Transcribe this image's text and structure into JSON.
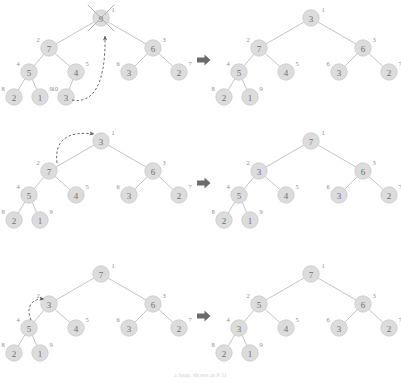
{
  "figure": {
    "implies_symbol": "⇒",
    "caption": "a heap, shown as 9 11",
    "colors": {
      "node_fill": "#dcdcdc",
      "node_stroke": "#c9c9c9",
      "edge": "#b4b4b4",
      "node_text": "#6f6f6f",
      "index_text": "#8d8d8d",
      "dashed_arrow": "#5a5a5a",
      "implies": "#6b6b6b",
      "background": "#ffffff"
    },
    "rows": [
      {
        "id": "row-1",
        "before": {
          "id": "tree-1-before",
          "nodes": [
            {
              "index": 1,
              "value": "9",
              "x": 101,
              "y": 18,
              "crossed": true
            },
            {
              "index": 2,
              "value": "7",
              "x": 49,
              "y": 48,
              "crossed": false
            },
            {
              "index": 3,
              "value": "6",
              "x": 153,
              "y": 48,
              "crossed": false
            },
            {
              "index": 4,
              "value": "5",
              "x": 29,
              "y": 72,
              "crossed": false
            },
            {
              "index": 5,
              "value": "4",
              "x": 76,
              "y": 72,
              "crossed": false
            },
            {
              "index": 6,
              "value": "3",
              "x": 129,
              "y": 72,
              "crossed": false
            },
            {
              "index": 7,
              "value": "2",
              "x": 179,
              "y": 72,
              "crossed": false
            },
            {
              "index": 8,
              "value": "2",
              "x": 14,
              "y": 97,
              "crossed": false
            },
            {
              "index": 9,
              "value": "1",
              "x": 40,
              "y": 97,
              "crossed": false
            },
            {
              "index": 10,
              "value": "3",
              "x": 66,
              "y": 97,
              "crossed": false
            }
          ],
          "edges": [
            [
              1,
              2
            ],
            [
              1,
              3
            ],
            [
              2,
              4
            ],
            [
              2,
              5
            ],
            [
              3,
              6
            ],
            [
              3,
              7
            ],
            [
              4,
              8
            ],
            [
              4,
              9
            ],
            [
              5,
              10
            ]
          ],
          "annotation": "last element 3 moves up to the root"
        },
        "after": {
          "id": "tree-1-after",
          "nodes": [
            {
              "index": 1,
              "value": "3",
              "x": 311,
              "y": 18,
              "crossed": false
            },
            {
              "index": 2,
              "value": "7",
              "x": 259,
              "y": 48,
              "crossed": false
            },
            {
              "index": 3,
              "value": "6",
              "x": 363,
              "y": 48,
              "crossed": false
            },
            {
              "index": 4,
              "value": "5",
              "x": 239,
              "y": 72,
              "crossed": false
            },
            {
              "index": 5,
              "value": "4",
              "x": 286,
              "y": 72,
              "crossed": false
            },
            {
              "index": 6,
              "value": "3",
              "x": 339,
              "y": 72,
              "crossed": false
            },
            {
              "index": 7,
              "value": "2",
              "x": 389,
              "y": 72,
              "crossed": false
            },
            {
              "index": 8,
              "value": "2",
              "x": 224,
              "y": 97,
              "crossed": false
            },
            {
              "index": 9,
              "value": "1",
              "x": 250,
              "y": 97,
              "crossed": false
            }
          ],
          "edges": [
            [
              1,
              2
            ],
            [
              1,
              3
            ],
            [
              2,
              4
            ],
            [
              2,
              5
            ],
            [
              3,
              6
            ],
            [
              3,
              7
            ],
            [
              4,
              8
            ],
            [
              4,
              9
            ]
          ]
        }
      },
      {
        "id": "row-2",
        "before": {
          "id": "tree-2-before",
          "nodes": [
            {
              "index": 1,
              "value": "3",
              "x": 101,
              "y": 141,
              "crossed": false
            },
            {
              "index": 2,
              "value": "7",
              "x": 49,
              "y": 171,
              "crossed": false
            },
            {
              "index": 3,
              "value": "6",
              "x": 153,
              "y": 171,
              "crossed": false
            },
            {
              "index": 4,
              "value": "5",
              "x": 29,
              "y": 195,
              "crossed": false
            },
            {
              "index": 5,
              "value": "4",
              "x": 76,
              "y": 195,
              "crossed": false
            },
            {
              "index": 6,
              "value": "3",
              "x": 129,
              "y": 195,
              "crossed": false
            },
            {
              "index": 7,
              "value": "2",
              "x": 179,
              "y": 195,
              "crossed": false
            },
            {
              "index": 8,
              "value": "2",
              "x": 14,
              "y": 220,
              "crossed": false
            },
            {
              "index": 9,
              "value": "1",
              "x": 40,
              "y": 220,
              "crossed": false
            }
          ],
          "edges": [
            [
              1,
              2
            ],
            [
              1,
              3
            ],
            [
              2,
              4
            ],
            [
              2,
              5
            ],
            [
              3,
              6
            ],
            [
              3,
              7
            ],
            [
              4,
              8
            ],
            [
              4,
              9
            ]
          ],
          "annotation": "swap root 3 with larger child 7"
        },
        "after": {
          "id": "tree-2-after",
          "nodes": [
            {
              "index": 1,
              "value": "7",
              "x": 311,
              "y": 141,
              "crossed": false
            },
            {
              "index": 2,
              "value": "3",
              "x": 259,
              "y": 171,
              "crossed": false
            },
            {
              "index": 3,
              "value": "6",
              "x": 363,
              "y": 171,
              "crossed": false
            },
            {
              "index": 4,
              "value": "5",
              "x": 239,
              "y": 195,
              "crossed": false
            },
            {
              "index": 5,
              "value": "4",
              "x": 286,
              "y": 195,
              "crossed": false
            },
            {
              "index": 6,
              "value": "3",
              "x": 339,
              "y": 195,
              "crossed": false
            },
            {
              "index": 7,
              "value": "2",
              "x": 389,
              "y": 195,
              "crossed": false
            },
            {
              "index": 8,
              "value": "2",
              "x": 224,
              "y": 220,
              "crossed": false
            },
            {
              "index": 9,
              "value": "1",
              "x": 250,
              "y": 220,
              "crossed": false
            }
          ],
          "edges": [
            [
              1,
              2
            ],
            [
              1,
              3
            ],
            [
              2,
              4
            ],
            [
              2,
              5
            ],
            [
              3,
              6
            ],
            [
              3,
              7
            ],
            [
              4,
              8
            ],
            [
              4,
              9
            ]
          ]
        }
      },
      {
        "id": "row-3",
        "before": {
          "id": "tree-3-before",
          "nodes": [
            {
              "index": 1,
              "value": "7",
              "x": 101,
              "y": 274,
              "crossed": false
            },
            {
              "index": 2,
              "value": "3",
              "x": 49,
              "y": 304,
              "crossed": false
            },
            {
              "index": 3,
              "value": "6",
              "x": 153,
              "y": 304,
              "crossed": false
            },
            {
              "index": 4,
              "value": "5",
              "x": 29,
              "y": 328,
              "crossed": false
            },
            {
              "index": 5,
              "value": "4",
              "x": 76,
              "y": 328,
              "crossed": false
            },
            {
              "index": 6,
              "value": "3",
              "x": 129,
              "y": 328,
              "crossed": false
            },
            {
              "index": 7,
              "value": "2",
              "x": 179,
              "y": 328,
              "crossed": false
            },
            {
              "index": 8,
              "value": "2",
              "x": 14,
              "y": 353,
              "crossed": false
            },
            {
              "index": 9,
              "value": "1",
              "x": 40,
              "y": 353,
              "crossed": false
            }
          ],
          "edges": [
            [
              1,
              2
            ],
            [
              1,
              3
            ],
            [
              2,
              4
            ],
            [
              2,
              5
            ],
            [
              3,
              6
            ],
            [
              3,
              7
            ],
            [
              4,
              8
            ],
            [
              4,
              9
            ]
          ],
          "annotation": "swap node 3 with larger child 5"
        },
        "after": {
          "id": "tree-3-after",
          "nodes": [
            {
              "index": 1,
              "value": "7",
              "x": 311,
              "y": 274,
              "crossed": false
            },
            {
              "index": 2,
              "value": "5",
              "x": 259,
              "y": 304,
              "crossed": false
            },
            {
              "index": 3,
              "value": "6",
              "x": 363,
              "y": 304,
              "crossed": false
            },
            {
              "index": 4,
              "value": "3",
              "x": 239,
              "y": 328,
              "crossed": false
            },
            {
              "index": 5,
              "value": "4",
              "x": 286,
              "y": 328,
              "crossed": false
            },
            {
              "index": 6,
              "value": "3",
              "x": 339,
              "y": 328,
              "crossed": false
            },
            {
              "index": 7,
              "value": "2",
              "x": 389,
              "y": 328,
              "crossed": false
            },
            {
              "index": 8,
              "value": "2",
              "x": 224,
              "y": 353,
              "crossed": false
            },
            {
              "index": 9,
              "value": "1",
              "x": 250,
              "y": 353,
              "crossed": false
            }
          ],
          "edges": [
            [
              1,
              2
            ],
            [
              1,
              3
            ],
            [
              2,
              4
            ],
            [
              2,
              5
            ],
            [
              3,
              6
            ],
            [
              3,
              7
            ],
            [
              4,
              8
            ],
            [
              4,
              9
            ]
          ]
        }
      }
    ],
    "implies_arrows": [
      {
        "id": "implies-1",
        "x": 203,
        "y": 60
      },
      {
        "id": "implies-2",
        "x": 203,
        "y": 183
      },
      {
        "id": "implies-3",
        "x": 203,
        "y": 316
      }
    ],
    "move_arrows": [
      {
        "id": "move-arrow-1",
        "path": "M 72 100 C 92 104 106 86 105 36",
        "row": 1
      },
      {
        "id": "move-arrow-2",
        "path": "M 57 163 C 54 138 70 131 94 134",
        "row": 2
      },
      {
        "id": "move-arrow-3",
        "path": "M 31 320 C 25 306 33 298 44 299",
        "row": 3
      }
    ]
  }
}
